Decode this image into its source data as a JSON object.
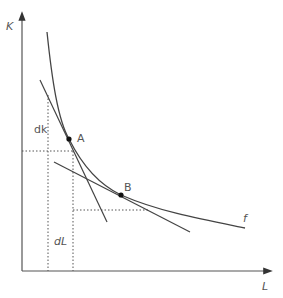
{
  "diagram": {
    "type": "isoquant",
    "axes": {
      "y_label": "K",
      "x_label": "L"
    },
    "curve_label": "f",
    "points": [
      {
        "name": "A",
        "x": 69,
        "y": 139
      },
      {
        "name": "B",
        "x": 121,
        "y": 195
      }
    ],
    "annotations": {
      "dk": "dk",
      "dl": "dL"
    },
    "colors": {
      "line": "#444444",
      "dotted": "#555555",
      "label": "#555555"
    }
  }
}
